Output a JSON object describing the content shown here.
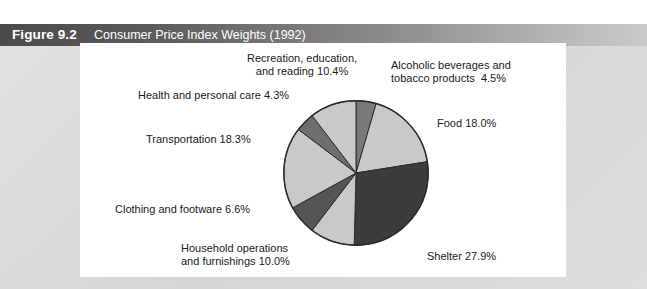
{
  "figure": {
    "number": "Figure 9.2",
    "caption": "Consumer Price Index Weights (1992)"
  },
  "colors": {
    "title_bar_dark": "#4a4a4a",
    "title_bar_light": "#c9c9c9",
    "frame_background": "#dcdcdc",
    "panel_background": "#ffffff",
    "slice_light": "#c9c9c9",
    "slice_medium": "#9a9a9a",
    "slice_dark": "#7a7a7a",
    "slice_darkest": "#3c3c3c",
    "slice_outline": "#2b2b2b",
    "label_text": "#1a1a1a"
  },
  "labels": {
    "recreation": "Recreation, education,\nand reading 10.4%",
    "alcohol": "Alcoholic beverages and\ntobacco products  4.5%",
    "health": "Health and personal care 4.3%",
    "food": "Food 18.0%",
    "transportation": "Transportation 18.3%",
    "clothing": "Clothing and footware 6.6%",
    "household": "Household operations\nand furnishings 10.0%",
    "shelter": "Shelter 27.9%"
  },
  "chart_data": {
    "type": "pie",
    "title": "Consumer Price Index Weights (1992)",
    "unit": "percent",
    "total": 100.0,
    "start_angle_deg": 0,
    "direction": "clockwise",
    "legend_position": "callout-labels",
    "grid": false,
    "slices": [
      {
        "label": "Alcoholic beverages and tobacco products",
        "value": 4.5,
        "color": "#7a7a7a"
      },
      {
        "label": "Food",
        "value": 18.0,
        "color": "#c9c9c9"
      },
      {
        "label": "Shelter",
        "value": 27.9,
        "color": "#3c3c3c"
      },
      {
        "label": "Household operations and furnishings",
        "value": 10.0,
        "color": "#c9c9c9"
      },
      {
        "label": "Clothing and footware",
        "value": 6.6,
        "color": "#555555"
      },
      {
        "label": "Transportation",
        "value": 18.3,
        "color": "#c9c9c9"
      },
      {
        "label": "Health and personal care",
        "value": 4.3,
        "color": "#6e6e6e"
      },
      {
        "label": "Recreation, education, and reading",
        "value": 10.4,
        "color": "#c9c9c9"
      }
    ],
    "categories": [
      "Alcoholic beverages and tobacco products",
      "Food",
      "Shelter",
      "Household operations and furnishings",
      "Clothing and footware",
      "Transportation",
      "Health and personal care",
      "Recreation, education, and reading"
    ],
    "values": [
      4.5,
      18.0,
      27.9,
      10.0,
      6.6,
      18.3,
      4.3,
      10.4
    ]
  }
}
